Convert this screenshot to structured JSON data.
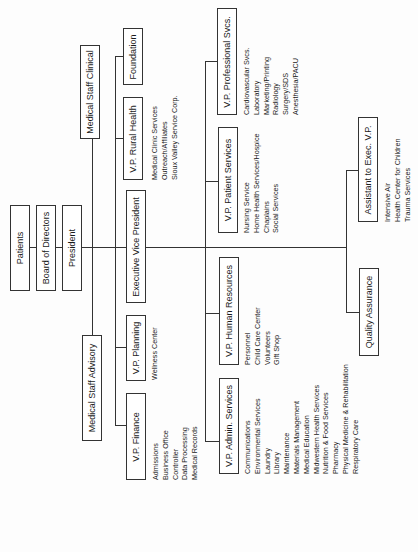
{
  "top_chain": {
    "patients": "Patients",
    "board": "Board of Directors",
    "president": "President"
  },
  "medical_staff": {
    "clinical": "Medical Staff Clinical",
    "advisory": "Medical Staff Advisory"
  },
  "president_reports": {
    "foundation": "Foundation",
    "rural_health": "V.P. Rural Health",
    "evp": "Executive Vice President",
    "planning": "V.P. Planning",
    "finance": "V.P. Finance"
  },
  "rural_health_items": [
    "Medical Clinic Services",
    "Outreach/Affiliates",
    "Sioux Valley Service Corp."
  ],
  "planning_items": [
    "Wellness Center"
  ],
  "finance_items": [
    "Admissions",
    "Business Office",
    "Controller",
    "Data Processing",
    "Medical Records"
  ],
  "evp_reports": {
    "professional": "V.P. Professional Svcs.",
    "patient": "V.P. Patient Services",
    "hr": "V.P. Human Resources",
    "admin": "V.P. Admin. Services"
  },
  "professional_items": [
    "Cardiovascular Svcs.",
    "Laboratory",
    "Marketing/Printing",
    "Radiology",
    "Surgery/SDS",
    "Anesthesia/PACU"
  ],
  "patient_items": [
    "Nursing Service",
    "Home Health Services/Hospice",
    "Chaplains",
    "Social Services"
  ],
  "hr_items": [
    "Personnel",
    "Child Care Center",
    "Volunteers",
    "Gift Shop"
  ],
  "admin_items": [
    "Communications",
    "Environmental Services",
    "Laundry",
    "Library",
    "Maintenance",
    "Materials Management",
    "Medical Education",
    "Midwestern Health Services",
    "Nutrition & Food Services",
    "Pharmacy",
    "Physical Medicine & Rehabilitation",
    "Respiratory Care"
  ],
  "evp_staff": {
    "assistant": "Assistant to Exec. V.P.",
    "quality": "Quality Assurance"
  },
  "assistant_items": [
    "Intensive Air",
    "Health Center for Children",
    "Trauma Services"
  ]
}
